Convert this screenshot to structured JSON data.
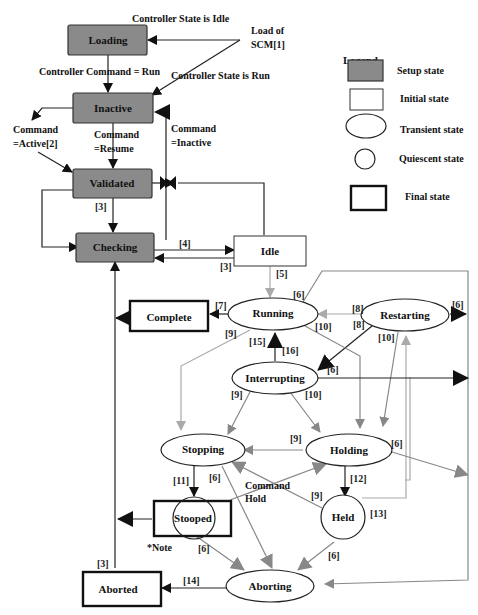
{
  "states": {
    "loading": "Loading",
    "inactive": "Inactive",
    "validated": "Validated",
    "checking": "Checking",
    "idle": "Idle",
    "running": "Running",
    "complete": "Complete",
    "restarting": "Restarting",
    "interrupting": "Interrupting",
    "stopping": "Stopping",
    "holding": "Holding",
    "stooped": "Stooped",
    "held": "Held",
    "aborting": "Aborting",
    "aborted": "Aborted"
  },
  "annotations": {
    "controller_state_idle": "Controller State is Idle",
    "load_of": "Load of",
    "scm": "SCM[1]",
    "controller_command_run": "Controller Command = Run",
    "controller_state_run": "Controller  State is Run",
    "command_active_1": "Command",
    "command_active_2": "=Active[2]",
    "command_resume_1": "Command",
    "command_resume_2": "=Resume",
    "command_inactive_1": "Command",
    "command_inactive_2": "=Inactive",
    "command_hold_1": "Command",
    "command_hold_2": "Hold",
    "note": "*Note"
  },
  "transition_labels": {
    "l3a": "[3]",
    "l4": "[4]",
    "l3b": "[3]",
    "l5": "[5]",
    "l6a": "[6]",
    "l7": "[7]",
    "l8a": "[8]",
    "l8b": "[8]",
    "l6b": "[6]",
    "l9a": "[9]",
    "l10a": "[10]",
    "l10b": "[10]",
    "l15": "[15]",
    "l16": "[16]",
    "l6c": "[6]",
    "l9b": "[9]",
    "l10c": "[10]",
    "l9c": "[9]",
    "l6d": "[6]",
    "l11": "[11]",
    "l6e": "[6]",
    "l12": "[12]",
    "l9d": "[9]",
    "l13": "[13]",
    "l6f": "[6]",
    "l6g": "[6]",
    "l3c": "[3]",
    "l14": "[14]"
  },
  "legend": {
    "title": "Legend",
    "items": [
      {
        "label": "Setup state"
      },
      {
        "label": "Initial state"
      },
      {
        "label": "Transient state"
      },
      {
        "label": "Quiescent state"
      },
      {
        "label": "Final state"
      }
    ]
  }
}
